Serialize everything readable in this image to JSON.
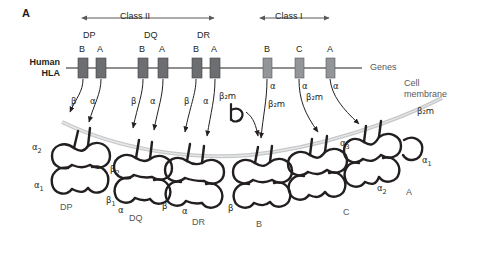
{
  "figure": {
    "panel_letter": "A",
    "organism_label_line1": "Human",
    "organism_label_line2": "HLA",
    "genes_label": "Genes",
    "membrane_label_line1": "Cell",
    "membrane_label_line2": "membrane",
    "class_regions": [
      {
        "id": "class-ii",
        "label": "Class II",
        "x_start": 85,
        "x_end": 216,
        "y": 18
      },
      {
        "id": "class-i",
        "label": "Class I",
        "x_start": 263,
        "x_end": 330,
        "y": 18
      }
    ],
    "gene_line": {
      "y": 68,
      "x_start": 66,
      "x_end": 362,
      "color": "#231f20"
    },
    "gene_groups": [
      {
        "name": "DP",
        "label_x": 86,
        "label_y": 37
      },
      {
        "name": "DQ",
        "label_x": 146,
        "label_y": 37
      },
      {
        "name": "DR",
        "label_x": 200,
        "label_y": 37
      }
    ],
    "genes": [
      {
        "id": "dp-b",
        "label": "B",
        "x": 78,
        "fill": "#6d6e71"
      },
      {
        "id": "dp-a",
        "label": "A",
        "x": 96,
        "fill": "#6d6e71"
      },
      {
        "id": "dq-b",
        "label": "B",
        "x": 138,
        "fill": "#6d6e71"
      },
      {
        "id": "dq-a",
        "label": "A",
        "x": 158,
        "fill": "#6d6e71"
      },
      {
        "id": "dr-b",
        "label": "B",
        "x": 192,
        "fill": "#6d6e71"
      },
      {
        "id": "dr-a",
        "label": "A",
        "x": 210,
        "fill": "#6d6e71"
      },
      {
        "id": "hla-b",
        "label": "B",
        "x": 263,
        "fill": "#939598"
      },
      {
        "id": "hla-c",
        "label": "C",
        "x": 295,
        "fill": "#939598"
      },
      {
        "id": "hla-a",
        "label": "A",
        "x": 326,
        "fill": "#939598"
      }
    ],
    "chain_labels": [
      {
        "text": "β",
        "x": 76,
        "y": 100
      },
      {
        "text": "α",
        "x": 96,
        "y": 100
      },
      {
        "text": "β",
        "x": 136,
        "y": 100
      },
      {
        "text": "α",
        "x": 156,
        "y": 100
      },
      {
        "text": "β",
        "x": 188,
        "y": 100
      },
      {
        "text": "α",
        "x": 208,
        "y": 100
      },
      {
        "text": "α",
        "x": 268,
        "y": 85
      },
      {
        "text": "α",
        "x": 300,
        "y": 85
      },
      {
        "text": "α",
        "x": 331,
        "y": 85
      }
    ],
    "b2m_labels": [
      {
        "text": "β₂m",
        "x": 224,
        "y": 95
      },
      {
        "text": "β₂m",
        "x": 272,
        "y": 103
      },
      {
        "text": "β₂m",
        "x": 310,
        "y": 96
      },
      {
        "text": "β₂m",
        "x": 420,
        "y": 110
      }
    ],
    "complex_names": [
      {
        "text": "DP",
        "x": 64,
        "y": 207
      },
      {
        "text": "DQ",
        "x": 133,
        "y": 218
      },
      {
        "text": "DR",
        "x": 196,
        "y": 222
      },
      {
        "text": "B",
        "x": 258,
        "y": 224
      },
      {
        "text": "C",
        "x": 345,
        "y": 212
      },
      {
        "text": "A",
        "x": 408,
        "y": 192
      }
    ],
    "domain_labels": [
      {
        "text": "α",
        "subscript": "2",
        "x": 36,
        "y": 147
      },
      {
        "text": "α",
        "subscript": "1",
        "x": 38,
        "y": 185
      },
      {
        "text": "β",
        "subscript": "2",
        "x": 104,
        "y": 169
      },
      {
        "text": "β",
        "subscript": "1",
        "x": 100,
        "y": 200
      },
      {
        "text": "α",
        "subscript": "",
        "x": 120,
        "y": 210
      },
      {
        "text": "β",
        "subscript": "",
        "x": 163,
        "y": 206
      },
      {
        "text": "α",
        "subscript": "",
        "x": 185,
        "y": 211
      },
      {
        "text": "β",
        "subscript": "",
        "x": 230,
        "y": 208
      },
      {
        "text": "α",
        "subscript": "3",
        "x": 343,
        "y": 143
      },
      {
        "text": "α",
        "subscript": "2",
        "x": 380,
        "y": 188
      },
      {
        "text": "α",
        "subscript": "1",
        "x": 425,
        "y": 160
      }
    ],
    "colors": {
      "ink": "#231f20",
      "gene_dark": "#6d6e71",
      "gene_light": "#939598",
      "membrane": "#c7c8ca",
      "label_gray": "#58595b"
    }
  }
}
